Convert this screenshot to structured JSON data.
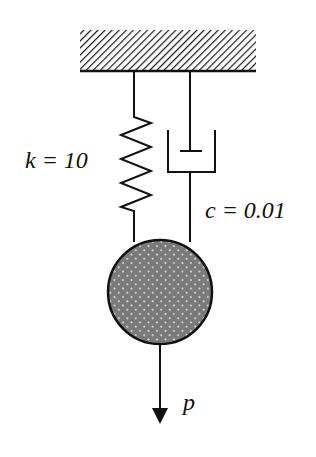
{
  "diagram": {
    "title": "",
    "type": "spring-mass-damper system",
    "components": {
      "support": {
        "name": "fixed ceiling",
        "style": "hatched"
      },
      "spring": {
        "symbol": "k",
        "value": "10",
        "label": "k = 10"
      },
      "damper": {
        "symbol": "c",
        "value": "0.01",
        "label": "c = 0.01"
      },
      "mass": {
        "name": "mass",
        "style": "dotted-gray-fill"
      },
      "force": {
        "symbol": "p",
        "label": "p",
        "direction": "down"
      }
    }
  },
  "colors": {
    "line": "#111111",
    "mass_fill": "#7a7a7a",
    "mass_dot": "#d8d8d8",
    "background": "#ffffff"
  }
}
